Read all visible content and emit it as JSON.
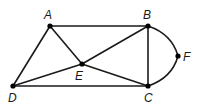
{
  "graph": {
    "vertices": [
      {
        "id": "A",
        "label": "A"
      },
      {
        "id": "B",
        "label": "B"
      },
      {
        "id": "C",
        "label": "C"
      },
      {
        "id": "D",
        "label": "D"
      },
      {
        "id": "E",
        "label": "E"
      },
      {
        "id": "F",
        "label": "F"
      }
    ],
    "edges": [
      {
        "from": "A",
        "to": "B",
        "type": "straight"
      },
      {
        "from": "A",
        "to": "D",
        "type": "straight"
      },
      {
        "from": "A",
        "to": "E",
        "type": "straight"
      },
      {
        "from": "B",
        "to": "E",
        "type": "straight"
      },
      {
        "from": "B",
        "to": "C",
        "type": "straight"
      },
      {
        "from": "D",
        "to": "E",
        "type": "straight"
      },
      {
        "from": "D",
        "to": "C",
        "type": "straight"
      },
      {
        "from": "E",
        "to": "C",
        "type": "straight"
      },
      {
        "from": "B",
        "to": "F",
        "type": "curved"
      },
      {
        "from": "F",
        "to": "C",
        "type": "curved"
      }
    ]
  }
}
